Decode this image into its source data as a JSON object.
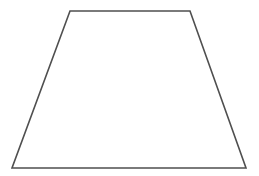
{
  "canvas": {
    "width": 259,
    "height": 176,
    "background_color": "#ffffff"
  },
  "figure": {
    "name": "trapezoid",
    "shape_type": "trapezoid",
    "fill": "none",
    "stroke_color": "#4f4f4f",
    "stroke_width": 1.6,
    "vertices": [
      {
        "label": "top-left",
        "x": 70,
        "y": 11
      },
      {
        "label": "top-right",
        "x": 190,
        "y": 11
      },
      {
        "label": "bottom-right",
        "x": 246,
        "y": 168
      },
      {
        "label": "bottom-left",
        "x": 12,
        "y": 168
      }
    ],
    "points_attr": "70,11 190,11 246,168 12,168",
    "edges": [
      {
        "name": "top-edge",
        "from": "top-left",
        "to": "top-right"
      },
      {
        "name": "right-edge",
        "from": "top-right",
        "to": "bottom-right"
      },
      {
        "name": "bottom-edge",
        "from": "bottom-right",
        "to": "bottom-left"
      },
      {
        "name": "left-edge",
        "from": "bottom-left",
        "to": "top-left"
      }
    ]
  }
}
